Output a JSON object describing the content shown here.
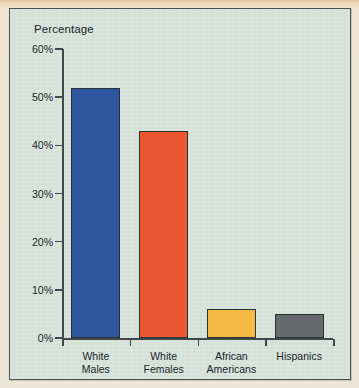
{
  "chart_data": {
    "type": "bar",
    "title": "",
    "ylabel": "Percentage",
    "xlabel": "",
    "categories": [
      "White Males",
      "White Females",
      "African Americans",
      "Hispanics"
    ],
    "category_lines": [
      [
        "White",
        "Males"
      ],
      [
        "White",
        "Females"
      ],
      [
        "African",
        "Americans"
      ],
      [
        "Hispanics"
      ]
    ],
    "values": [
      52,
      43,
      6,
      5
    ],
    "value_labels": [
      "52%",
      "43%",
      "6%",
      "5%"
    ],
    "ylim": [
      0,
      60
    ],
    "ytick_values": [
      0,
      10,
      20,
      30,
      40,
      50,
      60
    ],
    "ytick_labels": [
      "0%",
      "10%",
      "20%",
      "30%",
      "40%",
      "50%",
      "60%"
    ],
    "grid": false,
    "legend": "none",
    "bar_colors": [
      "#2d55a0",
      "#e9562f",
      "#f5b942",
      "#666a6c"
    ],
    "bar_outline_color": "#2b3033",
    "axis_color": "#3f484c",
    "plot_background": "#d6e2da",
    "page_background": "#eee6d5",
    "text_color": "#20262b"
  }
}
